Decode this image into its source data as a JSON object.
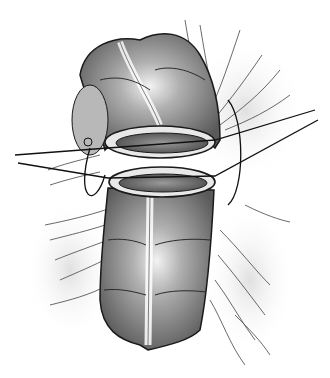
{
  "image": {
    "subject": "intestinal anastomosis illustration",
    "style": "grayscale pencil medical illustration",
    "background": "#ffffff",
    "colors": {
      "bowel_fill": "#8c8c8c",
      "bowel_highlight": "#e8e8e8",
      "bowel_dark": "#3a3a3a",
      "outline": "#1a1a1a",
      "lumen": "#6a6a6a",
      "mesentery_line": "#444444"
    }
  }
}
